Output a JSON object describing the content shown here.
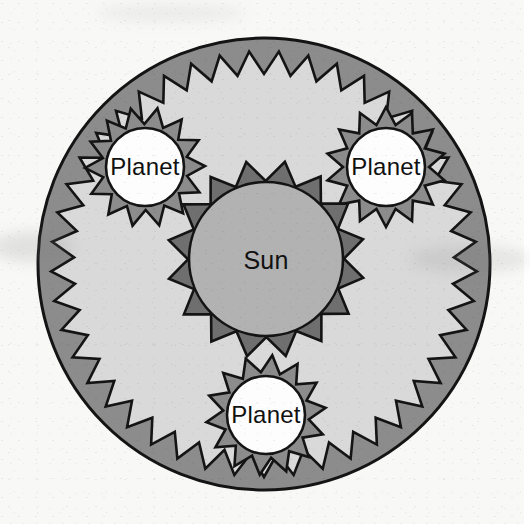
{
  "canvas": {
    "width": 524,
    "height": 524,
    "background_color": "#f8f8f6",
    "title": "Sun and Planets"
  },
  "palette": {
    "outer_ring_fill": "#8c8c8c",
    "orbit_starburst_fill": "#d9d9d9",
    "sun_starburst_fill": "#6f6f6f",
    "sun_disc_fill": "#b2b2b2",
    "planet_starburst_fill": "#8c8c8c",
    "planet_disc_fill": "#fdfdfd",
    "outline_color": "#141414",
    "label_color": "#111111"
  },
  "shapes": {
    "outer_circle": {
      "name": "outer-boundary-circle",
      "cx": 264,
      "cy": 264,
      "r": 226,
      "fill": "#8c8c8c",
      "stroke": "#141414",
      "stroke_width": 3
    },
    "orbit_starburst": {
      "name": "orbit-region-starburst",
      "cx": 264,
      "cy": 264,
      "outer_r": 213,
      "inner_r": 190,
      "points": 45,
      "rotation_deg": 4,
      "fill": "#d9d9d9",
      "stroke": "#141414",
      "stroke_width": 2.6
    },
    "sun": {
      "name": "sun",
      "cx": 266,
      "cy": 259,
      "burst_outer_r": 99,
      "burst_inner_r": 78,
      "burst_points": 16,
      "burst_rotation_deg": 11,
      "burst_fill": "#6f6f6f",
      "disc_r": 77,
      "disc_fill": "#b2b2b2",
      "stroke": "#141414",
      "stroke_width": 2.6,
      "label": "Sun",
      "label_x": 266,
      "label_y": 262
    },
    "planets": [
      {
        "name": "planet-upper-left",
        "cx": 145,
        "cy": 167,
        "burst_outer_r": 60,
        "burst_inner_r": 43,
        "burst_points": 14,
        "burst_rotation_deg": 12,
        "burst_fill": "#8c8c8c",
        "disc_r": 39,
        "disc_fill": "#fdfdfd",
        "stroke": "#141414",
        "stroke_width": 2.6,
        "label": "Planet",
        "label_x": 145,
        "label_y": 169
      },
      {
        "name": "planet-upper-right",
        "cx": 386,
        "cy": 167,
        "burst_outer_r": 60,
        "burst_inner_r": 43,
        "burst_points": 14,
        "burst_rotation_deg": 0,
        "burst_fill": "#8c8c8c",
        "disc_r": 39,
        "disc_fill": "#fdfdfd",
        "stroke": "#141414",
        "stroke_width": 2.6,
        "label": "Planet",
        "label_x": 386,
        "label_y": 169
      },
      {
        "name": "planet-bottom",
        "cx": 266,
        "cy": 415,
        "burst_outer_r": 60,
        "burst_inner_r": 43,
        "burst_points": 14,
        "burst_rotation_deg": 6,
        "burst_fill": "#8c8c8c",
        "disc_r": 39,
        "disc_fill": "#fdfdfd",
        "stroke": "#141414",
        "stroke_width": 2.6,
        "label": "Planet",
        "label_x": 266,
        "label_y": 417
      }
    ]
  },
  "labels": {
    "sun": "Sun",
    "planet_upper_left": "Planet",
    "planet_upper_right": "Planet",
    "planet_bottom": "Planet"
  }
}
